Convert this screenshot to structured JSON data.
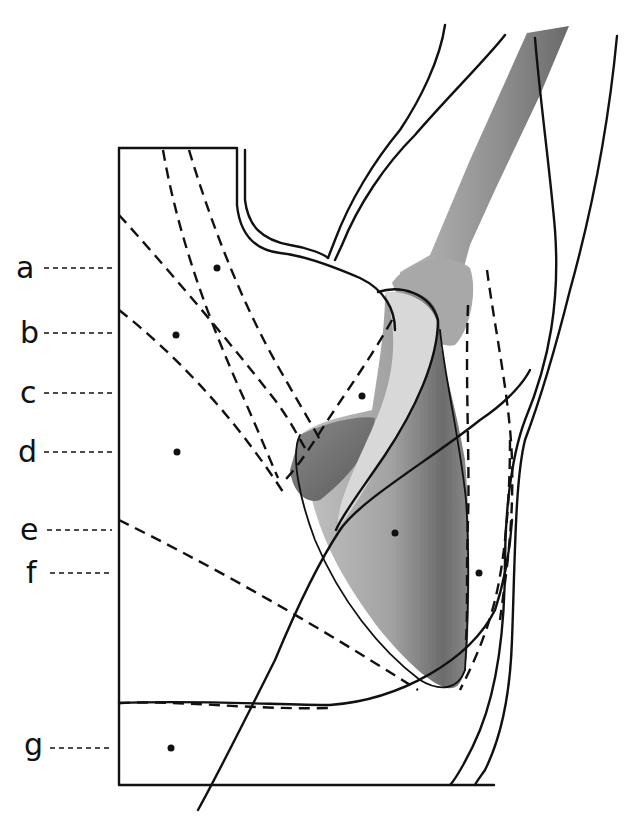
{
  "figure": {
    "type": "anatomical-diagram",
    "labels": [
      {
        "id": "a",
        "text": "a",
        "y": 268
      },
      {
        "id": "b",
        "text": "b",
        "y": 333
      },
      {
        "id": "c",
        "text": "c",
        "y": 393
      },
      {
        "id": "d",
        "text": "d",
        "y": 452
      },
      {
        "id": "e",
        "text": "e",
        "y": 530
      },
      {
        "id": "f",
        "text": "f",
        "y": 573
      },
      {
        "id": "g",
        "text": "g",
        "y": 748
      }
    ],
    "colors": {
      "ink": "#111111",
      "bone_light": "#c8c8c8",
      "bone_mid": "#9a9a9a",
      "bone_dark": "#5e5e5e",
      "background": "#ffffff"
    }
  }
}
